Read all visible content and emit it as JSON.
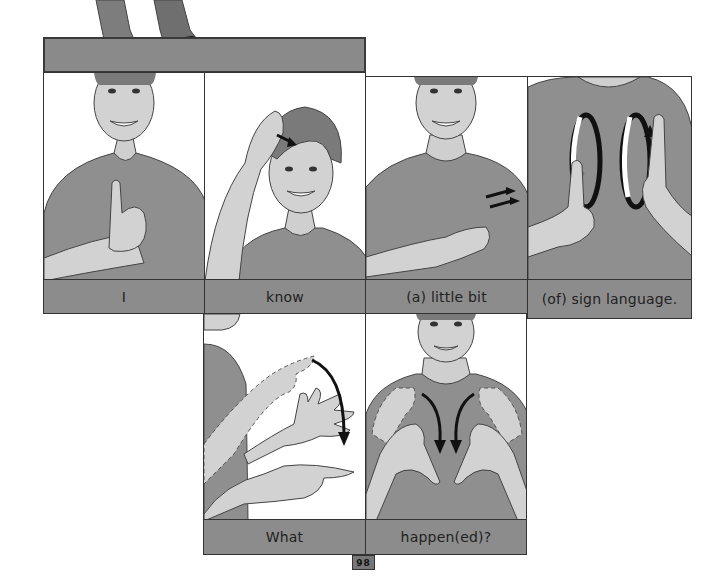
{
  "page": {
    "page_number": "98",
    "colors": {
      "label_bg": "#8c8c8c",
      "border": "#333333",
      "shirt": "#8f8f8f",
      "skin": "#d2d2d2",
      "hair": "#7a7a7a"
    }
  },
  "top_figure": {
    "description": "legs-and-shoes"
  },
  "row1": [
    {
      "label": "I",
      "illustration": "sign-i-pinky-on-chest"
    },
    {
      "label": "know",
      "illustration": "sign-know-hand-on-forehead"
    },
    {
      "label": "(a) little bit",
      "illustration": "sign-little-bit-fingers-rub"
    },
    {
      "label": "(of) sign language.",
      "illustration": "sign-language-circling-pinkies"
    }
  ],
  "row2": [
    {
      "label": "What",
      "illustration": "sign-what-finger-across-palm"
    },
    {
      "label": "happen(ed)?",
      "illustration": "sign-happen-hands-flip"
    }
  ]
}
